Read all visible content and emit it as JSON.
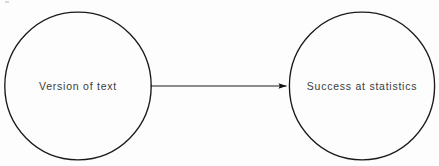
{
  "diagram": {
    "type": "path-diagram",
    "background_color": "#fdfdfd",
    "stroke_color": "#1a1a1a",
    "text_color": "#3b3b3b",
    "nodes": [
      {
        "id": "version-of-text",
        "label": "Version of text",
        "shape": "circle",
        "cx": 78,
        "cy": 86,
        "r": 73.5
      },
      {
        "id": "success-at-statistics",
        "label": "Success at statistics",
        "shape": "circle",
        "cx": 362,
        "cy": 86,
        "r": 73
      }
    ],
    "edges": [
      {
        "id": "version-to-success",
        "from": "version-of-text",
        "to": "success-at-statistics",
        "label": "",
        "style": "solid",
        "arrowhead": "filled-triangle",
        "direction": "right",
        "x1": 150,
        "x2": 288,
        "y": 86
      }
    ]
  }
}
